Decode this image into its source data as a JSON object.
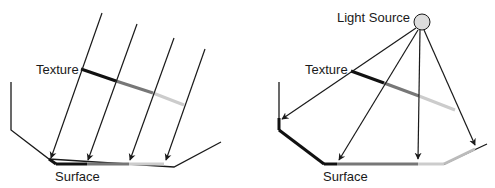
{
  "left_panel": {
    "title": "Parallel (directional) projection",
    "texture_label": "Texture",
    "surface_label": "Surface",
    "texture_label_pos": [
      36,
      63
    ],
    "surface_label_pos": [
      55,
      170
    ],
    "surface_outline": [
      [
        11,
        82
      ],
      [
        11,
        130
      ],
      [
        49,
        159
      ],
      [
        174,
        167
      ],
      [
        221,
        142
      ]
    ],
    "surface_colored_segments": [
      {
        "from": [
          49,
          159
        ],
        "to": [
          56,
          164
        ],
        "color": "#111111"
      },
      {
        "from": [
          56,
          164
        ],
        "to": [
          87,
          164
        ],
        "color": "#111111"
      },
      {
        "from": [
          87,
          164
        ],
        "to": [
          129,
          164
        ],
        "color": "#777777"
      },
      {
        "from": [
          129,
          164
        ],
        "to": [
          164,
          164
        ],
        "color": "#cccccc"
      }
    ],
    "texture_segments": [
      {
        "from": [
          81,
          69
        ],
        "to": [
          116,
          81
        ],
        "color": "#111111"
      },
      {
        "from": [
          116,
          81
        ],
        "to": [
          153,
          93
        ],
        "color": "#777777"
      },
      {
        "from": [
          153,
          93
        ],
        "to": [
          184,
          105
        ],
        "color": "#cccccc"
      }
    ],
    "rays": [
      {
        "from": [
          102,
          13
        ],
        "to": [
          51,
          158
        ]
      },
      {
        "from": [
          137,
          24
        ],
        "to": [
          88,
          160
        ]
      },
      {
        "from": [
          174,
          38
        ],
        "to": [
          130,
          160
        ]
      },
      {
        "from": [
          205,
          49
        ],
        "to": [
          166,
          160
        ]
      }
    ]
  },
  "right_panel": {
    "title": "Point light source projection",
    "light_source_label": "Light Source",
    "texture_label": "Texture",
    "surface_label": "Surface",
    "light_source_label_pos": [
      337,
      11
    ],
    "texture_label_pos": [
      305,
      63
    ],
    "surface_label_pos": [
      323,
      170
    ],
    "light_source": {
      "cx": 422,
      "cy": 22,
      "r": 8,
      "fill": "#dddddd"
    },
    "surface_outline": [
      [
        279,
        82
      ],
      [
        279,
        130
      ],
      [
        324,
        164
      ],
      [
        444,
        164
      ],
      [
        487,
        144
      ]
    ],
    "surface_colored_segments": [
      {
        "from": [
          279,
          118
        ],
        "to": [
          279,
          130
        ],
        "color": "#111111"
      },
      {
        "from": [
          279,
          130
        ],
        "to": [
          324,
          164
        ],
        "color": "#111111"
      },
      {
        "from": [
          324,
          164
        ],
        "to": [
          337,
          164
        ],
        "color": "#111111"
      },
      {
        "from": [
          337,
          164
        ],
        "to": [
          418,
          164
        ],
        "color": "#777777"
      },
      {
        "from": [
          418,
          164
        ],
        "to": [
          444,
          164
        ],
        "color": "#cccccc"
      },
      {
        "from": [
          444,
          164
        ],
        "to": [
          475,
          149
        ],
        "color": "#bbbbbb"
      }
    ],
    "texture_segments": [
      {
        "from": [
          351,
          71
        ],
        "to": [
          384,
          83
        ],
        "color": "#111111"
      },
      {
        "from": [
          384,
          83
        ],
        "to": [
          419,
          96
        ],
        "color": "#777777"
      },
      {
        "from": [
          419,
          96
        ],
        "to": [
          455,
          110
        ],
        "color": "#cccccc"
      }
    ],
    "rays": [
      {
        "from": [
          416,
          28
        ],
        "to": [
          282,
          119
        ]
      },
      {
        "from": [
          418,
          30
        ],
        "to": [
          339,
          160
        ]
      },
      {
        "from": [
          420,
          30
        ],
        "to": [
          418,
          159
        ]
      },
      {
        "from": [
          424,
          30
        ],
        "to": [
          475,
          145
        ]
      }
    ]
  },
  "style": {
    "line_color": "#1a1a1a",
    "ray_width": 1.2,
    "outline_width": 1.3,
    "texture_width": 3,
    "surface_width": 3
  }
}
